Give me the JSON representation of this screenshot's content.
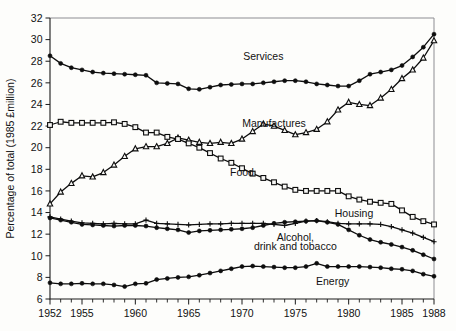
{
  "chart_data": {
    "type": "line",
    "title": "",
    "xlabel": "",
    "ylabel": "Percentage of total (1985 £million)",
    "xlim": [
      1952,
      1988
    ],
    "ylim": [
      6,
      32
    ],
    "ytick_step": 2,
    "yticks": [
      6,
      8,
      10,
      12,
      14,
      16,
      18,
      20,
      22,
      24,
      26,
      28,
      30,
      32
    ],
    "xticks_major": [
      1952,
      1955,
      1960,
      1965,
      1970,
      1975,
      1980,
      1985,
      1988
    ],
    "xticks_minor_step": 1,
    "grid": "none",
    "legend_position": "inline-annotations",
    "x": [
      1952,
      1953,
      1954,
      1955,
      1956,
      1957,
      1958,
      1959,
      1960,
      1961,
      1962,
      1963,
      1964,
      1965,
      1966,
      1967,
      1968,
      1969,
      1970,
      1971,
      1972,
      1973,
      1974,
      1975,
      1976,
      1977,
      1978,
      1979,
      1980,
      1981,
      1982,
      1983,
      1984,
      1985,
      1986,
      1987,
      1988
    ],
    "series": [
      {
        "name": "Services",
        "marker": "filled-circle",
        "values": [
          28.5,
          27.8,
          27.4,
          27.2,
          27.0,
          26.9,
          26.85,
          26.8,
          26.75,
          26.7,
          26.0,
          25.95,
          25.9,
          25.45,
          25.4,
          25.6,
          25.8,
          25.85,
          25.9,
          25.9,
          26.0,
          26.1,
          26.2,
          26.2,
          26.1,
          25.9,
          25.8,
          25.7,
          25.7,
          26.2,
          26.8,
          27.0,
          27.2,
          27.6,
          28.4,
          29.3,
          30.5
        ]
      },
      {
        "name": "Manufactures",
        "marker": "open-triangle",
        "values": [
          14.8,
          15.9,
          16.7,
          17.4,
          17.3,
          17.7,
          18.4,
          19.2,
          19.9,
          20.1,
          20.1,
          20.4,
          20.9,
          20.7,
          20.5,
          20.4,
          20.5,
          20.4,
          20.8,
          21.5,
          22.2,
          22.0,
          21.6,
          21.2,
          21.4,
          21.7,
          22.4,
          23.5,
          24.2,
          24.0,
          23.9,
          24.6,
          25.4,
          26.4,
          27.2,
          28.3,
          29.9
        ]
      },
      {
        "name": "Food",
        "marker": "open-square",
        "values": [
          22.1,
          22.4,
          22.3,
          22.3,
          22.3,
          22.3,
          22.35,
          22.2,
          21.9,
          21.4,
          21.4,
          21.0,
          20.8,
          20.4,
          20.0,
          19.5,
          19.0,
          18.6,
          18.1,
          17.6,
          17.2,
          16.8,
          16.4,
          16.1,
          16.0,
          16.0,
          16.0,
          16.0,
          15.5,
          15.2,
          15.0,
          14.9,
          14.8,
          14.2,
          13.6,
          13.2,
          12.9
        ]
      },
      {
        "name": "Housing",
        "marker": "plus",
        "values": [
          13.6,
          13.4,
          13.2,
          13.05,
          13.0,
          12.95,
          13.0,
          12.95,
          12.95,
          13.3,
          13.0,
          12.95,
          12.9,
          12.85,
          12.9,
          12.95,
          12.95,
          13.0,
          13.0,
          13.0,
          13.0,
          12.9,
          12.8,
          13.0,
          13.2,
          13.25,
          13.15,
          13.0,
          12.95,
          12.95,
          12.95,
          12.9,
          12.7,
          12.4,
          12.1,
          11.7,
          11.3
        ]
      },
      {
        "name": "Alcohol, drink and tobacco",
        "marker": "filled-circle",
        "values": [
          13.5,
          13.3,
          13.1,
          12.9,
          12.85,
          12.8,
          12.75,
          12.8,
          12.8,
          12.75,
          12.6,
          12.5,
          12.4,
          12.15,
          12.3,
          12.35,
          12.4,
          12.45,
          12.5,
          12.6,
          12.8,
          13.0,
          13.1,
          13.15,
          13.2,
          13.25,
          13.1,
          12.9,
          12.4,
          11.9,
          11.5,
          11.25,
          11.05,
          10.8,
          10.5,
          10.1,
          9.7
        ]
      },
      {
        "name": "Energy",
        "marker": "filled-circle",
        "values": [
          7.5,
          7.4,
          7.4,
          7.45,
          7.4,
          7.4,
          7.3,
          7.15,
          7.4,
          7.45,
          7.8,
          7.9,
          8.0,
          8.05,
          8.2,
          8.4,
          8.6,
          8.8,
          9.0,
          9.05,
          9.0,
          8.95,
          8.9,
          8.9,
          9.0,
          9.3,
          9.0,
          9.0,
          9.0,
          9.0,
          8.95,
          8.9,
          8.8,
          8.75,
          8.6,
          8.3,
          8.1
        ]
      }
    ],
    "annotations": [
      {
        "text": "Services",
        "x": 1972.0,
        "y": 28.1,
        "name": "services"
      },
      {
        "text": "Manufactures",
        "x": 1973.0,
        "y": 21.9,
        "name": "manufactures"
      },
      {
        "text": "Food",
        "x": 1970.0,
        "y": 17.4,
        "name": "food"
      },
      {
        "text": "Housing",
        "x": 1980.5,
        "y": 13.6,
        "name": "housing"
      },
      {
        "text": "Alcohol,",
        "x": 1975.0,
        "y": 11.4,
        "name": "alcohol-line1"
      },
      {
        "text": "drink and tobacco",
        "x": 1975.0,
        "y": 10.55,
        "name": "alcohol-line2"
      },
      {
        "text": "Energy",
        "x": 1978.5,
        "y": 7.3,
        "name": "energy"
      }
    ]
  }
}
